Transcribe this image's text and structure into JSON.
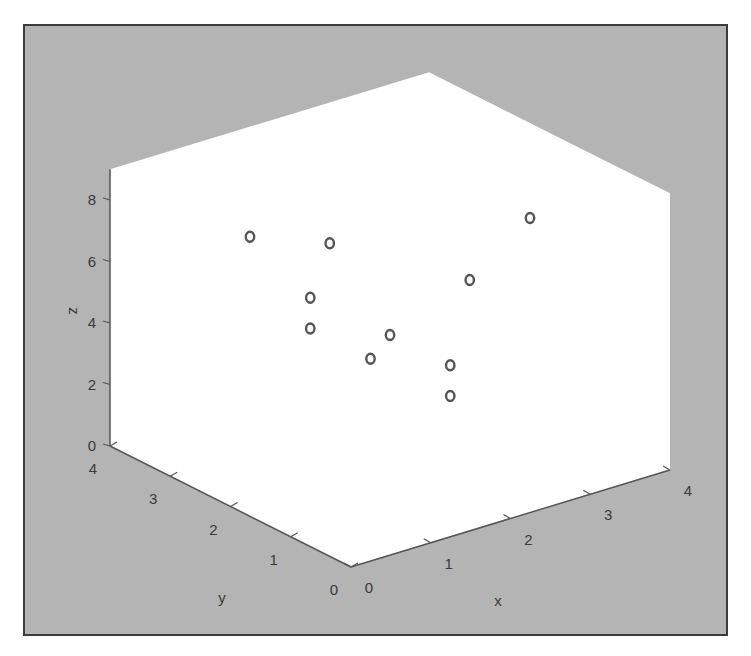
{
  "chart_data": {
    "type": "scatter3d",
    "title": "",
    "xlabel": "x",
    "ylabel": "y",
    "zlabel": "z",
    "xlim": [
      0,
      4
    ],
    "ylim": [
      0,
      4
    ],
    "zlim": [
      0,
      9
    ],
    "xticks": [
      "0",
      "1",
      "2",
      "3",
      "4"
    ],
    "yticks": [
      "0",
      "1",
      "2",
      "3",
      "4"
    ],
    "zticks": [
      "0",
      "2",
      "4",
      "6",
      "8"
    ],
    "grid": false,
    "marker": "o",
    "points": [
      {
        "x": 1,
        "y": 3,
        "z": 7
      },
      {
        "x": 2,
        "y": 3,
        "z": 6
      },
      {
        "x": 1,
        "y": 2,
        "z": 6
      },
      {
        "x": 1,
        "y": 2,
        "z": 5
      },
      {
        "x": 2,
        "y": 2,
        "z": 4
      },
      {
        "x": 1,
        "y": 1,
        "z": 5
      },
      {
        "x": 2,
        "y": 1,
        "z": 4
      },
      {
        "x": 2,
        "y": 1,
        "z": 3
      },
      {
        "x": 3,
        "y": 2,
        "z": 5
      },
      {
        "x": 3,
        "y": 1,
        "z": 8
      }
    ]
  },
  "colors": {
    "figure_background": "#b4b4b4",
    "axes_background": "#ffffff",
    "frame": "#3c3c3c",
    "marker": "#555555",
    "text": "#3a3a3a"
  },
  "labels": {
    "x": "x",
    "y": "y",
    "z": "z"
  }
}
